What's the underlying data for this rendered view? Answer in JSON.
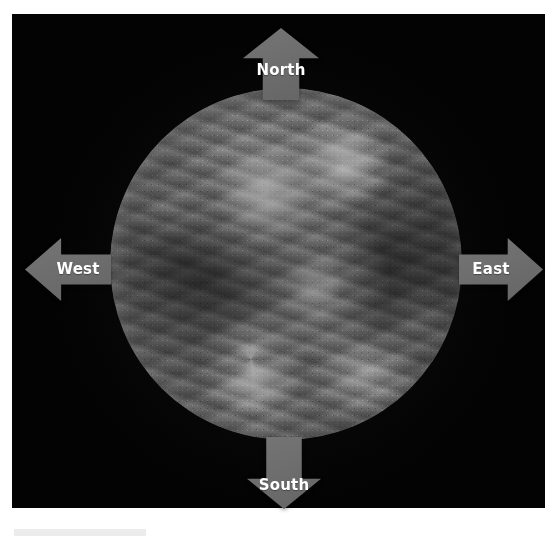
{
  "figure": {
    "background_color": "#ffffff",
    "space_color": "#030303"
  },
  "globe": {
    "name": "earth-satellite-disc",
    "description": "Grayscale full-disc satellite image of Earth showing cloud swirls, continents and a southern-hemisphere cyclone",
    "rendering": "grayscale",
    "center_x": 286,
    "center_y": 270,
    "radius": 176
  },
  "arrows": {
    "color": "#6b6b6b",
    "label_color": "#ffffff",
    "items": [
      {
        "id": "north",
        "label": "North",
        "direction": "up",
        "icon": "arrow-up-icon"
      },
      {
        "id": "west",
        "label": "West",
        "direction": "left",
        "icon": "arrow-left-icon"
      },
      {
        "id": "east",
        "label": "East",
        "direction": "right",
        "icon": "arrow-right-icon"
      },
      {
        "id": "south",
        "label": "South",
        "direction": "down",
        "icon": "arrow-down-icon"
      }
    ]
  },
  "caption_strip": {
    "visible": true,
    "color": "#ececec"
  }
}
